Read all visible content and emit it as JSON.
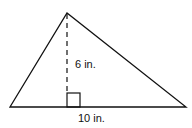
{
  "diagram": {
    "type": "triangle",
    "labels": {
      "height": "6 in.",
      "base": "10 in."
    },
    "height_value": 6,
    "base_value": 10,
    "unit": "in.",
    "right_angle_marker": true,
    "colors": {
      "stroke": "#111111",
      "background": "#ffffff"
    }
  }
}
